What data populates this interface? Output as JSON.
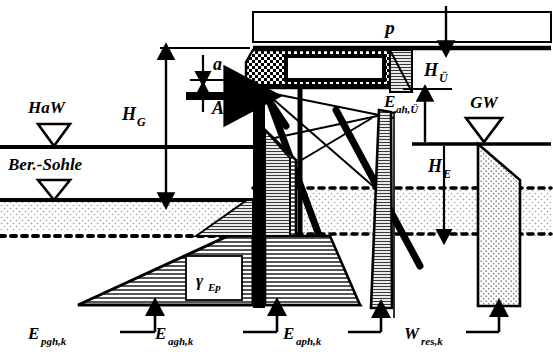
{
  "diagram": {
    "type": "geotechnical-section",
    "colors": {
      "ink": "#000000",
      "hatch_gray": "#bdbdbd",
      "stipple_gray": "#d9d9d9",
      "water_fill": "#e0e0e0",
      "background": "#ffffff"
    }
  },
  "labels": {
    "surcharge": "p",
    "high_water": "HaW",
    "bed_level": "Ber.-Sohle",
    "ground_water": "GW",
    "anchor_force": "A",
    "anchor_spacing": "a",
    "total_height": "H",
    "total_height_sub": "G",
    "surcharge_height": "H",
    "surcharge_height_sub": "Ü",
    "embedment_height": "H",
    "embedment_height_sub": "E",
    "active_surcharge": "E",
    "active_surcharge_sub": "ah,Ü",
    "passive_earth": "E",
    "passive_earth_sub": "pgh,k",
    "active_earth": "E",
    "active_earth_sub": "agh,k",
    "active_cohesion": "E",
    "active_cohesion_sub": "aph,k",
    "water_resultant": "W",
    "water_resultant_sub": "res,k",
    "gamma_ep": "γ",
    "gamma_ep_sub": "Ep"
  },
  "elements": {
    "surcharge_box": "surcharge-load-box",
    "wall": "sheet-pile-wall",
    "capping_beam": "capping-beam",
    "anchor": "anchor-rod",
    "water_triangle_haw": "water-level-symbol",
    "water_triangle_ber": "water-level-symbol",
    "water_triangle_gw": "water-level-symbol"
  }
}
